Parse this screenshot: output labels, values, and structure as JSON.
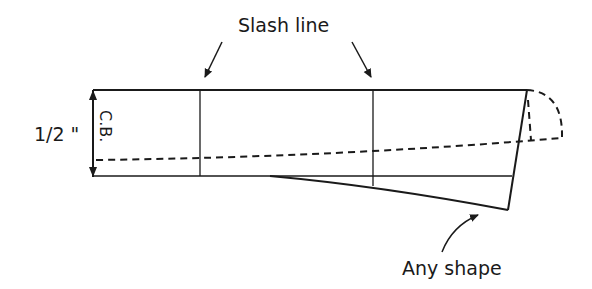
{
  "diagram": {
    "labels": {
      "slash_line": "Slash line",
      "any_shape": "Any shape",
      "half_inch": "1/2 \"",
      "center_back": "C.B."
    },
    "colors": {
      "stroke": "#1a1a1a",
      "background": "#ffffff"
    }
  }
}
